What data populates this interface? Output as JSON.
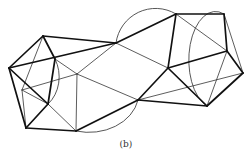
{
  "figure": {
    "caption": "(b)",
    "stroke_color": "#111111",
    "thin_stroke_color": "#333333",
    "vertices": {
      "A": [
        43,
        36
      ],
      "B": [
        9,
        68
      ],
      "C": [
        26,
        128
      ],
      "D": [
        55,
        59
      ],
      "E": [
        48,
        104
      ],
      "P": [
        22,
        90
      ],
      "F": [
        76,
        131
      ],
      "G": [
        77,
        74
      ],
      "H": [
        116,
        43
      ],
      "I": [
        176,
        14
      ],
      "J": [
        224,
        14
      ],
      "K": [
        227,
        51
      ],
      "L": [
        243,
        73
      ],
      "M": [
        168,
        68
      ],
      "N": [
        138,
        100
      ],
      "O": [
        207,
        106
      ]
    },
    "heavy_edges": [
      [
        "A",
        "B"
      ],
      [
        "B",
        "C"
      ],
      [
        "A",
        "D"
      ],
      [
        "D",
        "E"
      ],
      [
        "E",
        "C"
      ],
      [
        "B",
        "E"
      ],
      [
        "C",
        "F"
      ],
      [
        "A",
        "H"
      ],
      [
        "B",
        "H"
      ],
      [
        "H",
        "I"
      ],
      [
        "I",
        "J"
      ],
      [
        "J",
        "K"
      ],
      [
        "K",
        "L"
      ],
      [
        "L",
        "O"
      ],
      [
        "M",
        "I"
      ],
      [
        "M",
        "K"
      ],
      [
        "M",
        "N"
      ],
      [
        "M",
        "O"
      ],
      [
        "O",
        "N"
      ],
      [
        "N",
        "F"
      ]
    ],
    "thin_edges": [
      [
        "A",
        "P"
      ],
      [
        "P",
        "E"
      ],
      [
        "P",
        "G"
      ],
      [
        "D",
        "G"
      ],
      [
        "G",
        "F"
      ],
      [
        "G",
        "H"
      ],
      [
        "G",
        "N"
      ],
      [
        "H",
        "M"
      ],
      [
        "I",
        "K"
      ],
      [
        "J",
        "L"
      ],
      [
        "K",
        "O"
      ],
      [
        "N",
        "L"
      ],
      [
        "E",
        "F"
      ],
      [
        "P",
        "C"
      ]
    ],
    "arcs": [
      {
        "d": "M 55 59 A 28 34 0 0 1 48 104",
        "weight": "thin"
      },
      {
        "d": "M 116 43 A 40 40 0 0 1 176 14",
        "weight": "thin"
      },
      {
        "d": "M 76 131 A 50 40 0 0 0 138 100",
        "weight": "thin"
      },
      {
        "d": "M 224 14 A 22 40 0 0 0 207 106",
        "weight": "thin"
      }
    ]
  }
}
